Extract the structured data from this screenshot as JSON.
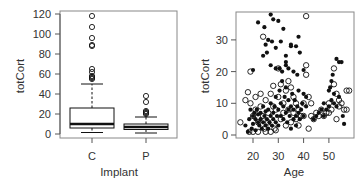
{
  "chart_data": [
    {
      "type": "box",
      "title": "",
      "xlabel": "Implant",
      "ylabel": "totCort",
      "categories": [
        "C",
        "P"
      ],
      "yticks": [
        0,
        20,
        40,
        60,
        80,
        100,
        120
      ],
      "ylim": [
        -2,
        122
      ],
      "grid": false,
      "boxes": [
        {
          "name": "C",
          "whisker_low": 1.5,
          "q1": 6,
          "median": 10,
          "q3": 26,
          "whisker_high": 50,
          "outliers": [
            55,
            56,
            57,
            58,
            62,
            65,
            88,
            89,
            96,
            107,
            118
          ]
        },
        {
          "name": "P",
          "whisker_low": 1,
          "q1": 4.5,
          "median": 7,
          "q3": 10,
          "whisker_high": 17,
          "outliers": [
            20,
            21,
            22,
            23,
            32,
            38
          ]
        }
      ]
    },
    {
      "type": "scatter",
      "title": "",
      "xlabel": "Age",
      "ylabel": "totCort",
      "xticks": [
        20,
        30,
        40,
        50
      ],
      "yticks": [
        0,
        10,
        20,
        30
      ],
      "xlim": [
        13.5,
        59.5
      ],
      "ylim": [
        -0.8,
        39
      ],
      "grid": false,
      "series": [
        {
          "name": "filled",
          "marker": "filled-circle",
          "points": [
            [
              20,
              20.5
            ],
            [
              22,
              35.5
            ],
            [
              24,
              25
            ],
            [
              24.5,
              34
            ],
            [
              25,
              28.5
            ],
            [
              25.5,
              26
            ],
            [
              26,
              30
            ],
            [
              27,
              22
            ],
            [
              27,
              38
            ],
            [
              27.5,
              29.5
            ],
            [
              28,
              36.5
            ],
            [
              29,
              21
            ],
            [
              29,
              27.5
            ],
            [
              30,
              36
            ],
            [
              30.5,
              21
            ],
            [
              31,
              29.5
            ],
            [
              31.5,
              20
            ],
            [
              32,
              33.5
            ],
            [
              33,
              25
            ],
            [
              33,
              22
            ],
            [
              34,
              21
            ],
            [
              35,
              28.5
            ],
            [
              35,
              28
            ],
            [
              36,
              20
            ],
            [
              37,
              28
            ],
            [
              37.5,
              19
            ],
            [
              38,
              31
            ],
            [
              38.5,
              26
            ],
            [
              40,
              20.5
            ],
            [
              33,
              23
            ],
            [
              17,
              3
            ],
            [
              18,
              1
            ],
            [
              18.5,
              5
            ],
            [
              19,
              8
            ],
            [
              19.5,
              2
            ],
            [
              20,
              6
            ],
            [
              20,
              3.5
            ],
            [
              20.5,
              7
            ],
            [
              21,
              5
            ],
            [
              21,
              1.5
            ],
            [
              21.5,
              8
            ],
            [
              22,
              4
            ],
            [
              22,
              6.5
            ],
            [
              22.5,
              3
            ],
            [
              23,
              7
            ],
            [
              23,
              5
            ],
            [
              23.5,
              2
            ],
            [
              24,
              9
            ],
            [
              24,
              4
            ],
            [
              24.5,
              6
            ],
            [
              25,
              3
            ],
            [
              25,
              7.5
            ],
            [
              25.5,
              5
            ],
            [
              26,
              2
            ],
            [
              26,
              8
            ],
            [
              26.5,
              4
            ],
            [
              27,
              6
            ],
            [
              27,
              10
            ],
            [
              27.5,
              3
            ],
            [
              28,
              7
            ],
            [
              28,
              5
            ],
            [
              28.5,
              9
            ],
            [
              29,
              4
            ],
            [
              29,
              12
            ],
            [
              29.5,
              6
            ],
            [
              30,
              8
            ],
            [
              30,
              3
            ],
            [
              30.5,
              14
            ],
            [
              31,
              6
            ],
            [
              31,
              10
            ],
            [
              31.5,
              17
            ],
            [
              32,
              5
            ],
            [
              32,
              9
            ],
            [
              32.5,
              12
            ],
            [
              33,
              7
            ],
            [
              33,
              15
            ],
            [
              33.5,
              4
            ],
            [
              34,
              8
            ],
            [
              34,
              11
            ],
            [
              34.5,
              6
            ],
            [
              35,
              2
            ],
            [
              35,
              9
            ],
            [
              35.5,
              13
            ],
            [
              36,
              5
            ],
            [
              36,
              8
            ],
            [
              36.5,
              11
            ],
            [
              37,
              6
            ],
            [
              37,
              3
            ],
            [
              37.5,
              9
            ],
            [
              38,
              7
            ],
            [
              38,
              14
            ],
            [
              38.5,
              5
            ],
            [
              39,
              8
            ],
            [
              39.5,
              10
            ],
            [
              40,
              6
            ],
            [
              40,
              13
            ],
            [
              41,
              9
            ],
            [
              41,
              12
            ],
            [
              44,
              5
            ],
            [
              45,
              6
            ],
            [
              46,
              7
            ],
            [
              47,
              8
            ],
            [
              48,
              10
            ],
            [
              48,
              6
            ],
            [
              49,
              8
            ],
            [
              50,
              9
            ],
            [
              50,
              14
            ],
            [
              50.5,
              15
            ],
            [
              51,
              11
            ],
            [
              51,
              17
            ],
            [
              51.5,
              19
            ],
            [
              52,
              10
            ],
            [
              52,
              13
            ],
            [
              53,
              24
            ],
            [
              53,
              9
            ],
            [
              54,
              23
            ],
            [
              54,
              12
            ],
            [
              55,
              23
            ],
            [
              55.5,
              6
            ],
            [
              56,
              3.5
            ]
          ]
        },
        {
          "name": "open",
          "marker": "open-circle",
          "points": [
            [
              15,
              4
            ],
            [
              17,
              11
            ],
            [
              18,
              13.5
            ],
            [
              18.5,
              1
            ],
            [
              19,
              20
            ],
            [
              19,
              10
            ],
            [
              20,
              6
            ],
            [
              20,
              1
            ],
            [
              21,
              12
            ],
            [
              21,
              8
            ],
            [
              22,
              4
            ],
            [
              22,
              1
            ],
            [
              23,
              13
            ],
            [
              23,
              9
            ],
            [
              24,
              31
            ],
            [
              24,
              6
            ],
            [
              24.5,
              2
            ],
            [
              25,
              11
            ],
            [
              25,
              1
            ],
            [
              26,
              7
            ],
            [
              26,
              4
            ],
            [
              27,
              13
            ],
            [
              27,
              1
            ],
            [
              28,
              15.5
            ],
            [
              28,
              9
            ],
            [
              28.5,
              2
            ],
            [
              29,
              8
            ],
            [
              29,
              1.5
            ],
            [
              30,
              21
            ],
            [
              30,
              12
            ],
            [
              31,
              16
            ],
            [
              31,
              5
            ],
            [
              32,
              10
            ],
            [
              32,
              7
            ],
            [
              33,
              14
            ],
            [
              33,
              3
            ],
            [
              34,
              17
            ],
            [
              34,
              8
            ],
            [
              35,
              15
            ],
            [
              35,
              4
            ],
            [
              36,
              12
            ],
            [
              36,
              7
            ],
            [
              37,
              10
            ],
            [
              37,
              5
            ],
            [
              38,
              8
            ],
            [
              38,
              3
            ],
            [
              39,
              6
            ],
            [
              40,
              10
            ],
            [
              40,
              6
            ],
            [
              41,
              37.5
            ],
            [
              41,
              22
            ],
            [
              41,
              19
            ],
            [
              42,
              12
            ],
            [
              42,
              2
            ],
            [
              43,
              10
            ],
            [
              43,
              6
            ],
            [
              44,
              5
            ],
            [
              45,
              7
            ],
            [
              46,
              6
            ],
            [
              47,
              8
            ],
            [
              48,
              6
            ],
            [
              49,
              7
            ],
            [
              50,
              10
            ],
            [
              50,
              7
            ],
            [
              51,
              8
            ],
            [
              52,
              16
            ],
            [
              52,
              21
            ],
            [
              53,
              13
            ],
            [
              53,
              5
            ],
            [
              54,
              11
            ],
            [
              54,
              9
            ],
            [
              55,
              10
            ],
            [
              56,
              8
            ],
            [
              57,
              14
            ],
            [
              58,
              14
            ],
            [
              57,
              8
            ]
          ]
        }
      ]
    }
  ],
  "labels": {
    "left_ylabel": "totCort",
    "left_xlabel": "Implant",
    "right_ylabel": "totCort",
    "right_xlabel": "Age"
  },
  "colors": {
    "frame": "#888888",
    "ink": "#111111",
    "text": "#333333",
    "box_fill": "#ffffff"
  }
}
